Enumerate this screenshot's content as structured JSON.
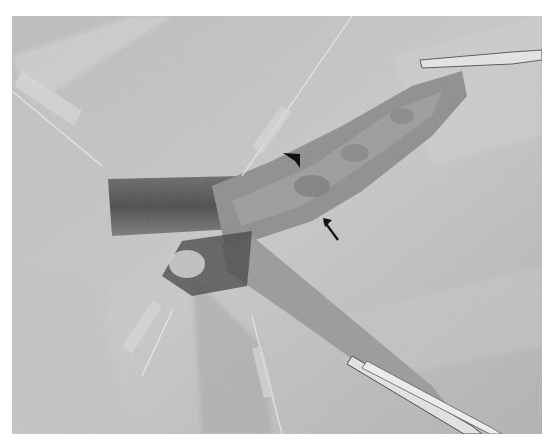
{
  "figure": {
    "palette": {
      "background": "#ffffff",
      "drape_light": "#cfcfcf",
      "drape_mid": "#b4b4b4",
      "tissue": "#8c8c8c",
      "tissue_dark": "#5e5e5e",
      "shadow": "#3c3c3c",
      "annotation": "#111111",
      "instrument": "#e8e8e8"
    },
    "annotations": [
      {
        "type": "arrowhead",
        "direction": "down-right",
        "position": [
          291,
          160
        ]
      },
      {
        "type": "arrow",
        "direction": "up-left",
        "tip": [
          323,
          218
        ],
        "tail": [
          338,
          240
        ]
      }
    ]
  }
}
